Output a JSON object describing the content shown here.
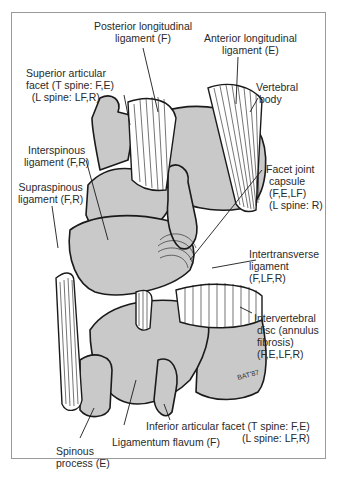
{
  "figure": {
    "type": "anatomical line illustration",
    "colors": {
      "bone_fill": "#c9c9c9",
      "outline": "#1a1a1a",
      "frame": "#9a9a9a",
      "text": "#2a2a2a"
    }
  },
  "labels": {
    "posterior_longitudinal": {
      "line1": "Posterior longitudinal",
      "line2": "ligament (F)"
    },
    "anterior_longitudinal": {
      "line1": "Anterior longitudinal",
      "line2": "ligament (E)"
    },
    "superior_articular": {
      "line1": "Superior articular",
      "line2": "facet (T spine: F,E)",
      "line3": "(L spine: LF,R)"
    },
    "vertebral_body": {
      "line1": "Vertebral",
      "line2": "body"
    },
    "interspinous": {
      "line1": "Interspinous",
      "line2": "ligament (F,R)"
    },
    "supraspinous": {
      "line1": "Supraspinous",
      "line2": "ligament (F,R)"
    },
    "facet_capsule": {
      "line1": "Facet joint",
      "line2": "capsule",
      "line3": "(F,E,LF)",
      "line4": "(L spine: R)"
    },
    "intertransverse": {
      "line1": "Intertransverse",
      "line2": "ligament",
      "line3": "(F,LF,R)"
    },
    "intervertebral_disc": {
      "line1": "Intervertebral",
      "line2": "disc (annulus",
      "line3": "fibrosis)",
      "line4": "(F,E,LF,R)"
    },
    "inferior_articular": {
      "line1": "Inferior articular facet (T spine: F,E)",
      "line2": "(L spine: LF,R)"
    },
    "ligamentum_flavum": {
      "line1": "Ligamentum flavum (F)"
    },
    "spinous_process": {
      "line1": "Spinous",
      "line2": "process (E)"
    },
    "artist_signature": "BAT'87"
  }
}
